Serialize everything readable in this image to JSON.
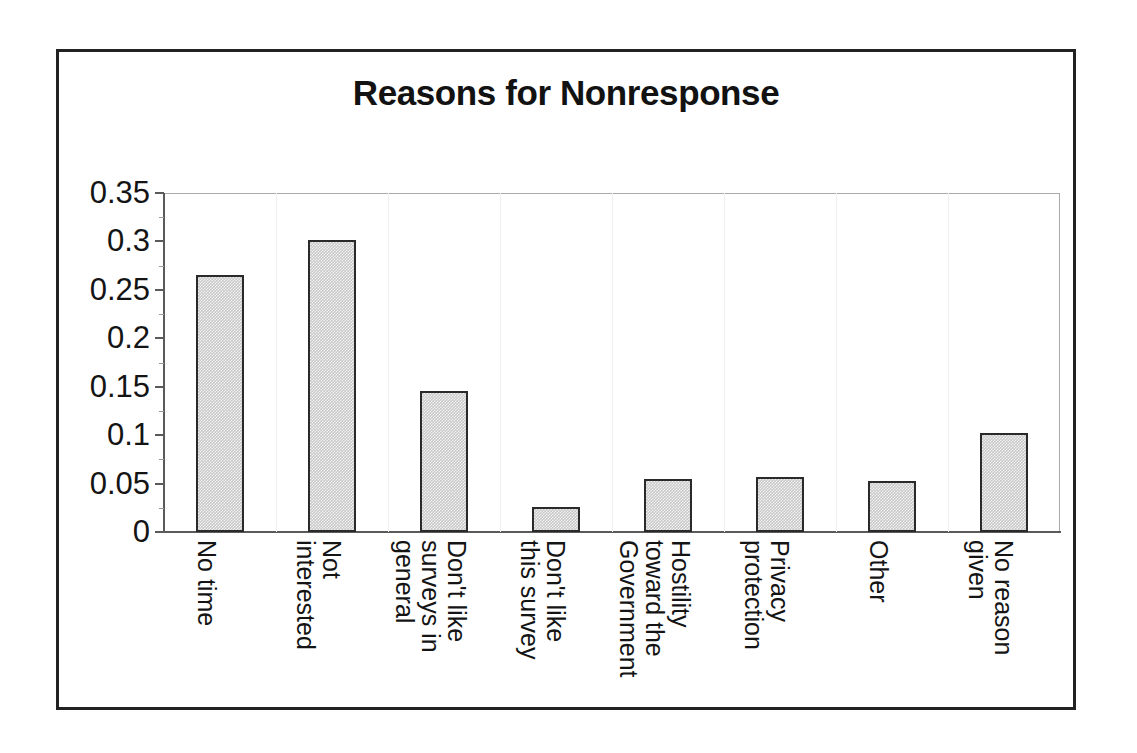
{
  "figure": {
    "title": "Reasons for Nonresponse",
    "frame_color": "#222222",
    "bar_fill": "#c9c9c9",
    "bar_border": "#2a2a2a",
    "axis_color": "#5a5a5a"
  },
  "chart_data": {
    "type": "bar",
    "title": "Reasons for Nonresponse",
    "xlabel": "",
    "ylabel": "",
    "ylim": [
      0,
      0.35
    ],
    "grid": false,
    "legend": "none",
    "ytick_labels": [
      "0.35",
      "0.3",
      "0.25",
      "0.2",
      "0.15",
      "0.1",
      "0.05",
      "0"
    ],
    "ytick_values": [
      0.35,
      0.3,
      0.25,
      0.2,
      0.15,
      0.1,
      0.05,
      0
    ],
    "categories": [
      "No time",
      "Not interested",
      "Don't like surveys in general",
      "Don't like this survey",
      "Hostility toward the Government",
      "Privacy protection",
      "Other",
      "No reason given"
    ],
    "category_label_lines": [
      [
        "No time"
      ],
      [
        "Not",
        "interested"
      ],
      [
        "Don't like",
        "surveys in",
        "general"
      ],
      [
        "Don't like",
        "this survey"
      ],
      [
        "Hostility",
        "toward the",
        "Government"
      ],
      [
        "Privacy",
        "protection"
      ],
      [
        "Other"
      ],
      [
        "No reason",
        "given"
      ]
    ],
    "values": [
      0.265,
      0.301,
      0.146,
      0.026,
      0.055,
      0.057,
      0.053,
      0.102
    ]
  }
}
